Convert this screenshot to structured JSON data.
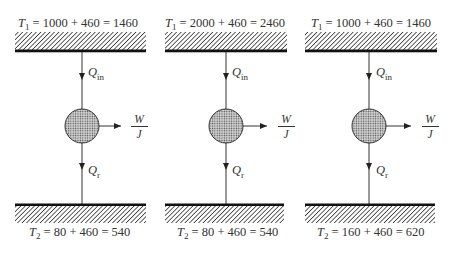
{
  "figure": {
    "colors": {
      "ink": "#333333",
      "reservoir_line": "#111111",
      "background": "#ffffff"
    },
    "panels": [
      {
        "hot_reservoir": {
          "symbol": "T",
          "subscript": "1",
          "expression": " = 1000 + 460 = 1460"
        },
        "heat_in": {
          "symbol": "Q",
          "subscript": "in"
        },
        "work": {
          "numerator": "W",
          "denominator": "J"
        },
        "heat_rejected": {
          "symbol": "Q",
          "subscript": "r"
        },
        "cold_reservoir": {
          "symbol": "T",
          "subscript": "2",
          "expression": " = 80 + 460 = 540"
        }
      },
      {
        "hot_reservoir": {
          "symbol": "T",
          "subscript": "1",
          "expression": " = 2000 + 460 = 2460"
        },
        "heat_in": {
          "symbol": "Q",
          "subscript": "in"
        },
        "work": {
          "numerator": "W",
          "denominator": "J"
        },
        "heat_rejected": {
          "symbol": "Q",
          "subscript": "r"
        },
        "cold_reservoir": {
          "symbol": "T",
          "subscript": "2",
          "expression": " = 80 + 460 = 540"
        }
      },
      {
        "hot_reservoir": {
          "symbol": "T",
          "subscript": "1",
          "expression": " = 1000 + 460 = 1460"
        },
        "heat_in": {
          "symbol": "Q",
          "subscript": "in"
        },
        "work": {
          "numerator": "W",
          "denominator": "J"
        },
        "heat_rejected": {
          "symbol": "Q",
          "subscript": "r"
        },
        "cold_reservoir": {
          "symbol": "T",
          "subscript": "2",
          "expression": " = 160 + 460 = 620"
        }
      }
    ]
  }
}
